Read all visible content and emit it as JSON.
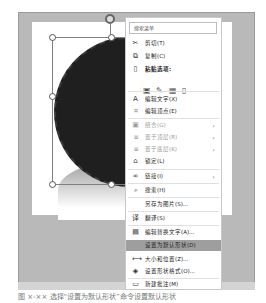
{
  "menu": {
    "search_placeholder": "搜索菜单",
    "items": [
      {
        "label": "剪切(T)",
        "icon": "scissors-icon",
        "glyph": "✂"
      },
      {
        "label": "复制(C)",
        "icon": "copy-icon",
        "glyph": "⧉"
      },
      {
        "label": "粘贴选项:",
        "icon": "clipboard-icon",
        "glyph": "📋"
      },
      {
        "label": "编辑文字(X)",
        "icon": "edit-text-icon",
        "glyph": "A"
      },
      {
        "label": "编辑顶点(E)",
        "icon": "edit-points-icon",
        "glyph": "⌗"
      },
      {
        "label": "组合(G)",
        "icon": "group-icon",
        "glyph": "▣",
        "submenu": true,
        "disabled": true
      },
      {
        "label": "置于顶层(R)",
        "icon": "bring-front-icon",
        "glyph": "⧈",
        "submenu": true,
        "disabled": true
      },
      {
        "label": "置于底层(K)",
        "icon": "send-back-icon",
        "glyph": "⧈",
        "submenu": true,
        "disabled": true
      },
      {
        "label": "锁定(L)",
        "icon": "lock-icon",
        "glyph": "🔒"
      },
      {
        "label": "链接(I)",
        "icon": "link-icon",
        "glyph": "∞",
        "submenu": true
      },
      {
        "label": "搜索(H)",
        "icon": "search-icon",
        "glyph": "⌕"
      },
      {
        "label": "另存为图片(S)...",
        "icon": "",
        "glyph": ""
      },
      {
        "label": "翻译(S)",
        "icon": "translate-icon",
        "glyph": "译"
      },
      {
        "label": "编辑替换文字(A)...",
        "icon": "alt-text-icon",
        "glyph": "▤"
      },
      {
        "label": "设置为默认形状(D)",
        "icon": "",
        "glyph": "",
        "highlighted": true
      },
      {
        "label": "大小和位置(Z)...",
        "icon": "size-position-icon",
        "glyph": "⟷"
      },
      {
        "label": "设置形状格式(O)...",
        "icon": "format-shape-icon",
        "glyph": "◈"
      },
      {
        "label": "新建批注(M)",
        "icon": "comment-icon",
        "glyph": "▭"
      }
    ],
    "paste_options": [
      "paste-use-destination-theme-icon",
      "paste-keep-source-icon",
      "paste-picture-icon",
      "paste-keep-text-icon"
    ],
    "submenu_arrow": "›"
  },
  "caption": "图 ×-×× 选择“设置为默认形状”命令设置默认形状"
}
